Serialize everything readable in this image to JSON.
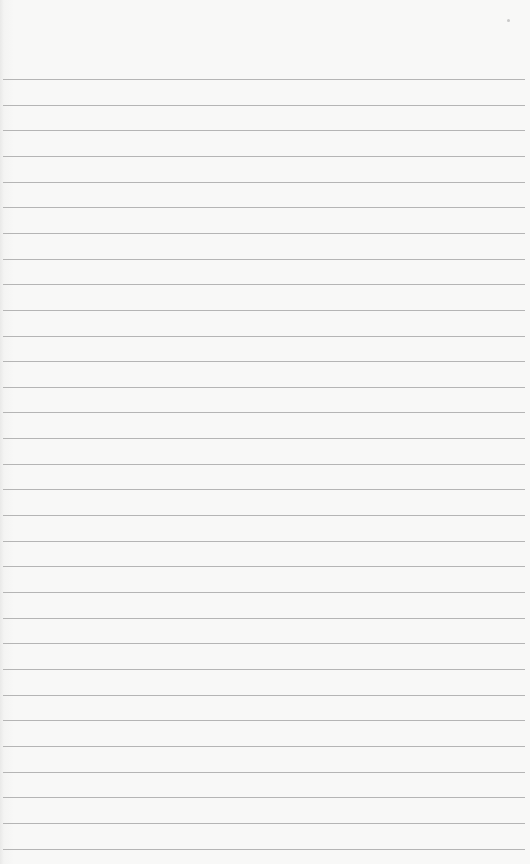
{
  "paper": {
    "background": "#f8f8f7",
    "line_color": "#a9a9a9",
    "line_count": 31,
    "first_line_y": 79,
    "line_spacing": 25.65
  },
  "specks": [
    {
      "x": 507,
      "y": 19
    }
  ]
}
